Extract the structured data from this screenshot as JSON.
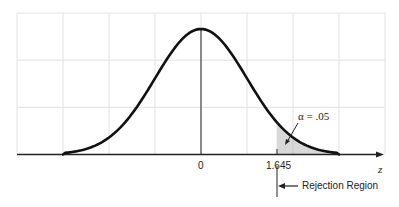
{
  "chart_data": {
    "type": "line",
    "title": "",
    "xlabel": "z",
    "ylabel": "",
    "distribution": "standard normal",
    "mean": 0,
    "sd": 1,
    "x_range": [
      -4,
      4
    ],
    "curve_x_extent": [
      -3,
      3
    ],
    "grid": true,
    "grid_x_positions": [
      -4,
      -3,
      -2,
      -1,
      0,
      1,
      2,
      3,
      4
    ],
    "grid_y_levels": 3,
    "tick_labels": [
      {
        "x": 0,
        "label": "0"
      },
      {
        "x": 1.645,
        "label": "1.645"
      }
    ],
    "shaded_region": {
      "from": 1.645,
      "to": 3,
      "color": "#d8d8d8"
    },
    "annotations": [
      {
        "text": "α = .05",
        "points_to": "shaded tail area"
      },
      {
        "text": "Rejection Region",
        "direction": "right of 1.645"
      }
    ],
    "legend": null
  },
  "labels": {
    "zero": "0",
    "critical": "1.645",
    "axis": "z",
    "alpha": "α = .05",
    "rejection": "Rejection Region"
  },
  "colors": {
    "curve": "#111111",
    "grid": "#e2e2e2",
    "shade": "#d8d8d8",
    "axis": "#222222"
  }
}
